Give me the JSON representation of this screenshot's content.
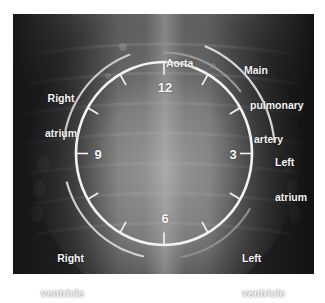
{
  "figure": {
    "type": "radiograph-clock-face-overlay",
    "clock": {
      "center": [
        164,
        153.5
      ],
      "rx": 88,
      "ry": 91.5,
      "numbers": [
        {
          "text": "12",
          "x": 165,
          "y": 87
        },
        {
          "text": "3",
          "x": 233,
          "y": 154
        },
        {
          "text": "9",
          "x": 98,
          "y": 154
        },
        {
          "text": "6",
          "x": 165,
          "y": 218
        }
      ]
    },
    "labels": {
      "aorta": [
        "Aorta"
      ],
      "main_pulmonary_artery": [
        "Main",
        "pulmonary",
        "artery"
      ],
      "right_atrium": [
        "Right",
        "atrium"
      ],
      "left_atrium": [
        "Left",
        "atrium"
      ],
      "right_ventricle": [
        "Right",
        "ventricle"
      ],
      "left_ventricle": [
        "Left",
        "ventricle"
      ]
    },
    "arcs": [
      {
        "name": "aorta-arc",
        "r": 97,
        "from_deg": 0,
        "to_deg": 52,
        "color": "#9a9a9a"
      },
      {
        "name": "main-pulmonary-artery-arc",
        "r": 111,
        "from_deg": 22,
        "to_deg": 84,
        "color": "#d6d6d6"
      },
      {
        "name": "right-atrium-arc",
        "r": 101,
        "from_deg": 278,
        "to_deg": 340,
        "color": "#c8c8c8"
      },
      {
        "name": "right-ventricle-arc",
        "r": 101,
        "from_deg": 192,
        "to_deg": 254,
        "color": "#cfcfcf"
      },
      {
        "name": "left-ventricle-arc",
        "r": 101,
        "from_deg": 122,
        "to_deg": 170,
        "color": "#8d8d8d"
      }
    ],
    "colors": {
      "clock_stroke": "#f2f2f2",
      "label_text": "#f4f4f4",
      "background": "#1a1a1a"
    }
  }
}
